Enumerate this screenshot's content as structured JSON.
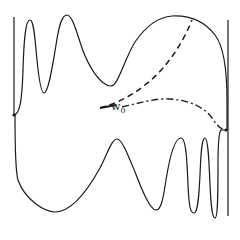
{
  "figure": {
    "type": "diagram",
    "colors": {
      "stroke": "#1a1a1a",
      "background": "#ffffff"
    },
    "label": {
      "symbol": "w",
      "subscript": "0"
    },
    "curves": {
      "left_line": "M14,17 L14,116",
      "right_line": "M228,20 L228,216",
      "upper_boundary": "M14,115 C20,114 22,100 23,70 C24,35 26,20 30,20 C34,20 35,40 37,60 C39,80 41,93 44,93 C48,93 52,70 56,45 C59,25 62,15 67,15 C72,15 76,30 82,48 C88,65 100,86 111,86 C118,86 124,60 135,42 C146,26 158,17 172,16 C190,15 205,22 215,35 C225,48 227,75 227,100 L227,130",
      "lower_boundary": "M15,115 C15,145 15,170 18,180 C25,200 45,212 55,212 C70,212 85,195 100,168 C108,152 112,139 117,139 C122,139 128,155 135,172 C142,190 150,210 156,210 C161,210 163,200 166,180 C170,155 175,138 181,138 C186,138 187,160 188,185 C189,205 190,213 194,213 C198,213 199,195 200,175 C201,150 202,138 205,138 C208,138 209,160 210,185 C211,205 212,218 215,218 C218,218 218,190 218,165 C218,145 219,132 221,130 L227,130",
      "dashed": "M100,108 C115,104 130,97 145,85 C165,70 182,45 192,20",
      "dash_dot": "M122,107 C140,103 155,98 170,99 C190,100 205,108 212,118 C216,124 220,130 227,130"
    },
    "points": [
      {
        "name": "left-endpoint",
        "x": 14,
        "y": 115
      },
      {
        "name": "right-endpoint",
        "x": 226,
        "y": 130
      }
    ]
  }
}
